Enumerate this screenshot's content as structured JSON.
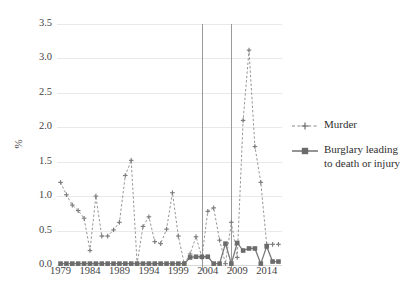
{
  "chart_data": {
    "type": "line",
    "title": "",
    "xlabel": "",
    "ylabel": "%",
    "xlim": [
      1978.4,
      2016.6
    ],
    "ylim": [
      0.0,
      3.5
    ],
    "ytick_labels": [
      "0.0",
      "0.5",
      "1.0",
      "1.5",
      "2.0",
      "2.5",
      "3.0",
      "3.5"
    ],
    "ytick_values": [
      0.0,
      0.5,
      1.0,
      1.5,
      2.0,
      2.5,
      3.0,
      3.5
    ],
    "xtick_labels": [
      "1979",
      "1984",
      "1989",
      "1994",
      "1999",
      "2004",
      "2009",
      "2014"
    ],
    "xtick_values": [
      1979,
      1984,
      1989,
      1994,
      1999,
      2004,
      2009,
      2014
    ],
    "grid": "horizontal",
    "legend_position": "right",
    "annotations": {
      "vertical_reference_lines": [
        2003,
        2008
      ]
    },
    "x": [
      1979,
      1980,
      1981,
      1982,
      1983,
      1984,
      1985,
      1986,
      1987,
      1988,
      1989,
      1990,
      1991,
      1992,
      1993,
      1994,
      1995,
      1996,
      1997,
      1998,
      1999,
      2000,
      2001,
      2002,
      2003,
      2004,
      2005,
      2006,
      2007,
      2008,
      2009,
      2010,
      2011,
      2012,
      2013,
      2014,
      2015,
      2016
    ],
    "series": [
      {
        "name": "Murder",
        "style": "dashed",
        "marker": "plus",
        "color": "#8a8a8a",
        "values": [
          1.2,
          1.02,
          0.87,
          0.79,
          0.68,
          0.21,
          1.0,
          0.42,
          0.42,
          0.51,
          0.62,
          1.3,
          1.52,
          0.02,
          0.56,
          0.7,
          0.34,
          0.31,
          0.52,
          1.05,
          0.42,
          0.02,
          0.16,
          0.41,
          0.11,
          0.78,
          0.83,
          0.36,
          0.02,
          0.62,
          0.11,
          2.1,
          3.12,
          1.72,
          1.2,
          0.3,
          0.3,
          0.3
        ]
      },
      {
        "name": "Burglary leading to death or injury",
        "style": "solid",
        "marker": "square",
        "color": "#7a7a7a",
        "values": [
          0.02,
          0.02,
          0.02,
          0.02,
          0.02,
          0.02,
          0.02,
          0.02,
          0.02,
          0.02,
          0.02,
          0.02,
          0.02,
          0.02,
          0.02,
          0.02,
          0.02,
          0.02,
          0.02,
          0.02,
          0.02,
          0.02,
          0.11,
          0.12,
          0.12,
          0.12,
          0.02,
          0.02,
          0.31,
          0.02,
          0.32,
          0.21,
          0.24,
          0.24,
          0.02,
          0.27,
          0.05,
          0.05
        ]
      }
    ]
  },
  "legend": {
    "items": [
      {
        "label": "Murder"
      },
      {
        "label": "Burglary leading to death or injury"
      }
    ]
  }
}
